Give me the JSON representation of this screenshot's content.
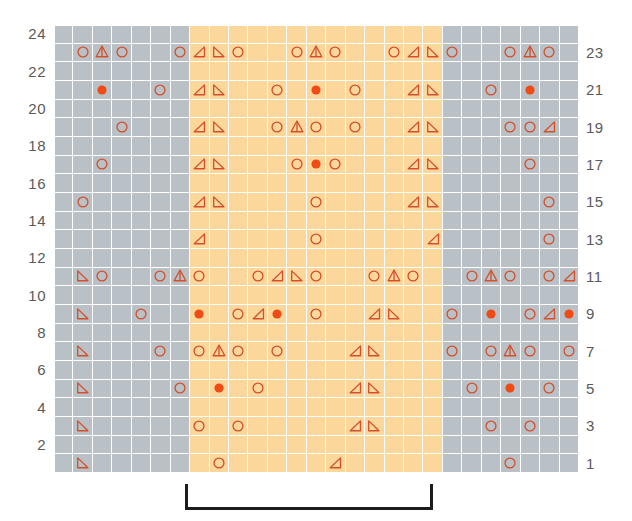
{
  "chart_meta": {
    "title": "Lace knitting chart",
    "columns": 27,
    "rows": 24,
    "repeat_start_col": 8,
    "repeat_end_col": 20,
    "colors": {
      "background_plain": "#b9c0c6",
      "background_repeat": "#fcd79b",
      "grid_line": "#ffffff",
      "symbol_outline": "#d4502a",
      "symbol_fill": "#f04b14",
      "symbol_muted": "#b06a55",
      "row_number": "#5a5a5a",
      "bracket": "#1c1c1c"
    }
  },
  "row_numbers_left": [
    "24",
    "22",
    "20",
    "18",
    "16",
    "14",
    "12",
    "10",
    "8",
    "6",
    "4",
    "2"
  ],
  "row_numbers_right": [
    "23",
    "21",
    "19",
    "17",
    "15",
    "13",
    "11",
    "9",
    "7",
    "5",
    "3",
    "1"
  ],
  "legend_symbols": {
    "yo": "open-circle-yarn-over",
    "dot": "filled-circle-bobble",
    "k2tog": "right-leaning-decrease-triangle",
    "ssk": "left-leaning-decrease-triangle",
    "cdd": "center-double-decrease-peak"
  },
  "repeat_bracket": {
    "label": "",
    "start_px": 185,
    "width_px": 248
  },
  "chart_data": {
    "type": "table",
    "xlabel": "stitch",
    "ylabel": "row",
    "columns": 27,
    "rows": 24,
    "symbol_key": {
      "o": "yarn over (open circle)",
      "d": "bobble / nupp (filled circle)",
      "L": "left-leaning decrease (triangle, right angle bottom-right)",
      "R": "right-leaning decrease (triangle, right angle bottom-left)",
      "A": "central double decrease (peak with stem)",
      ".": "empty / knit stitch"
    },
    "grid": [
      {
        "row": 23,
        "cells": [
          "",
          "o",
          "A",
          "o",
          "",
          "",
          "o",
          "L",
          "R",
          "o",
          "",
          "",
          "o",
          "A",
          "o",
          "",
          "",
          "o",
          "L",
          "R",
          "o",
          "",
          "",
          "o",
          "A",
          "o",
          ""
        ]
      },
      {
        "row": 22,
        "cells": [
          "",
          "",
          "",
          "",
          "",
          "",
          "",
          "",
          "",
          "",
          "",
          "",
          "",
          "",
          "",
          "",
          "",
          "",
          "",
          "",
          "",
          "",
          "",
          "",
          "",
          "",
          ""
        ]
      },
      {
        "row": 21,
        "cells": [
          "",
          "",
          "d",
          "",
          "o",
          "",
          "L",
          "R",
          "",
          "o",
          "",
          "d",
          "",
          "o",
          "",
          "d",
          "",
          "o",
          "",
          "L",
          "R",
          "",
          "o",
          "",
          "d",
          "",
          ""
        ]
      },
      {
        "row": 20,
        "cells": [
          "",
          "",
          "",
          "",
          "",
          "",
          "",
          "",
          "",
          "",
          "",
          "",
          "",
          "",
          "",
          "",
          "",
          "",
          "",
          "",
          "",
          "",
          "",
          "",
          "",
          "",
          ""
        ]
      },
      {
        "row": 19,
        "cells": [
          "",
          "",
          "",
          "o",
          "",
          "",
          "L",
          "R",
          "",
          "",
          "o",
          "",
          "o",
          "A",
          "o",
          "",
          "",
          "o",
          "",
          "",
          "L",
          "R",
          "",
          "",
          "o",
          "",
          "L"
        ]
      },
      {
        "row": 18,
        "cells": [
          "",
          "",
          "",
          "",
          "",
          "",
          "",
          "",
          "",
          "",
          "",
          "",
          "",
          "",
          "",
          "",
          "",
          "",
          "",
          "",
          "",
          "",
          "",
          "",
          "",
          "",
          ""
        ]
      },
      {
        "row": 17,
        "cells": [
          "",
          "",
          "o",
          "",
          "",
          "",
          "L",
          "R",
          "",
          "",
          "",
          "o",
          "",
          "d",
          "",
          "o",
          "",
          "",
          "",
          "L",
          "R",
          "",
          "",
          "",
          "o",
          "",
          ""
        ]
      },
      {
        "row": 16,
        "cells": [
          "",
          "",
          "",
          "",
          "",
          "",
          "",
          "",
          "",
          "",
          "",
          "",
          "",
          "",
          "",
          "",
          "",
          "",
          "",
          "",
          "",
          "",
          "",
          "",
          "",
          "",
          ""
        ]
      },
      {
        "row": 15,
        "cells": [
          "",
          "o",
          "",
          "",
          "",
          "",
          "L",
          "R",
          "",
          "",
          "",
          "",
          "o",
          "",
          "o",
          "",
          "",
          "",
          "",
          "L",
          "R",
          "",
          "",
          "",
          "",
          "o",
          ""
        ]
      },
      {
        "row": 14,
        "cells": [
          "",
          "",
          "",
          "",
          "",
          "",
          "",
          "",
          "",
          "",
          "",
          "",
          "",
          "",
          "",
          "",
          "",
          "",
          "",
          "",
          "",
          "",
          "",
          "",
          "",
          "",
          ""
        ]
      },
      {
        "row": 13,
        "cells": [
          "",
          "",
          "",
          "",
          "",
          "",
          "",
          "L",
          "",
          "",
          "",
          "",
          "",
          "o",
          "",
          "",
          "",
          "",
          "",
          "",
          "L",
          "",
          "",
          "",
          "",
          "",
          "o"
        ]
      },
      {
        "row": 12,
        "cells": [
          "",
          "",
          "",
          "",
          "",
          "",
          "",
          "",
          "",
          "",
          "",
          "",
          "",
          "",
          "",
          "",
          "",
          "",
          "",
          "",
          "",
          "",
          "",
          "",
          "",
          "",
          ""
        ]
      },
      {
        "row": 11,
        "cells": [
          "",
          "R",
          "o",
          "",
          "",
          "o",
          "A",
          "o",
          "",
          "",
          "o",
          "L",
          "R",
          "o",
          "",
          "",
          "o",
          "A",
          "o",
          "",
          "",
          "o",
          "A",
          "o",
          "",
          "",
          "o",
          "L"
        ]
      },
      {
        "row": 10,
        "cells": [
          "",
          "",
          "",
          "",
          "",
          "",
          "",
          "",
          "",
          "",
          "",
          "",
          "",
          "",
          "",
          "",
          "",
          "",
          "",
          "",
          "",
          "",
          "",
          "",
          "",
          "",
          ""
        ]
      },
      {
        "row": 9,
        "cells": [
          "",
          "R",
          "",
          "",
          "o",
          "",
          "",
          "d",
          "",
          "o",
          "L",
          "d",
          "",
          "o",
          "",
          "",
          "L",
          "R",
          "",
          "",
          "o",
          "",
          "",
          "d",
          "",
          "o",
          "L",
          "d"
        ]
      },
      {
        "row": 8,
        "cells": [
          "",
          "",
          "",
          "",
          "",
          "",
          "",
          "",
          "",
          "",
          "",
          "",
          "",
          "",
          "",
          "",
          "",
          "",
          "",
          "",
          "",
          "",
          "",
          "",
          "",
          "",
          ""
        ]
      },
      {
        "row": 7,
        "cells": [
          "",
          "R",
          "",
          "",
          "",
          "o",
          "",
          "o",
          "A",
          "o",
          "",
          "o",
          "",
          "",
          "",
          "L",
          "R",
          "",
          "",
          "",
          "o",
          "",
          "o",
          "A",
          "o",
          "",
          "o",
          ""
        ]
      },
      {
        "row": 6,
        "cells": [
          "",
          "",
          "",
          "",
          "",
          "",
          "",
          "",
          "",
          "",
          "",
          "",
          "",
          "",
          "",
          "",
          "",
          "",
          "",
          "",
          "",
          "",
          "",
          "",
          "",
          "",
          ""
        ]
      },
      {
        "row": 5,
        "cells": [
          "",
          "R",
          "",
          "",
          "",
          "",
          "o",
          "",
          "d",
          "",
          "o",
          "",
          "",
          "",
          "",
          "L",
          "R",
          "",
          "",
          "",
          "",
          "o",
          "",
          "d",
          "",
          "o",
          "",
          ""
        ]
      },
      {
        "row": 4,
        "cells": [
          "",
          "",
          "",
          "",
          "",
          "",
          "",
          "",
          "",
          "",
          "",
          "",
          "",
          "",
          "",
          "",
          "",
          "",
          "",
          "",
          "",
          "",
          "",
          "",
          "",
          "",
          ""
        ]
      },
      {
        "row": 3,
        "cells": [
          "",
          "R",
          "",
          "",
          "",
          "",
          "",
          "o",
          "",
          "o",
          "",
          "",
          "",
          "",
          "",
          "L",
          "R",
          "",
          "",
          "",
          "",
          "",
          "o",
          "",
          "o",
          "",
          "",
          ""
        ]
      },
      {
        "row": 2,
        "cells": [
          "",
          "",
          "",
          "",
          "",
          "",
          "",
          "",
          "",
          "",
          "",
          "",
          "",
          "",
          "",
          "",
          "",
          "",
          "",
          "",
          "",
          "",
          "",
          "",
          "",
          "",
          ""
        ]
      },
      {
        "row": 1,
        "cells": [
          "",
          "R",
          "",
          "",
          "",
          "",
          "",
          "",
          "o",
          "",
          "",
          "",
          "",
          "",
          "L",
          "",
          "",
          "",
          "",
          "",
          "",
          "",
          "",
          "o",
          "",
          "",
          "",
          ""
        ]
      }
    ],
    "symbols_by_row": {
      "23": [
        {
          "c": 2,
          "s": "o"
        },
        {
          "c": 3,
          "s": "A"
        },
        {
          "c": 4,
          "s": "o"
        },
        {
          "c": 7,
          "s": "o"
        },
        {
          "c": 8,
          "s": "L"
        },
        {
          "c": 9,
          "s": "R"
        },
        {
          "c": 10,
          "s": "o"
        },
        {
          "c": 13,
          "s": "o"
        },
        {
          "c": 14,
          "s": "A"
        },
        {
          "c": 15,
          "s": "o"
        },
        {
          "c": 18,
          "s": "o"
        },
        {
          "c": 19,
          "s": "L"
        },
        {
          "c": 20,
          "s": "R"
        },
        {
          "c": 21,
          "s": "o"
        },
        {
          "c": 24,
          "s": "o"
        },
        {
          "c": 25,
          "s": "A"
        },
        {
          "c": 26,
          "s": "o"
        }
      ],
      "21": [
        {
          "c": 3,
          "s": "d"
        },
        {
          "c": 6,
          "s": "o"
        },
        {
          "c": 8,
          "s": "L"
        },
        {
          "c": 9,
          "s": "R"
        },
        {
          "c": 12,
          "s": "o"
        },
        {
          "c": 14,
          "s": "d"
        },
        {
          "c": 16,
          "s": "o"
        },
        {
          "c": 19,
          "s": "L"
        },
        {
          "c": 20,
          "s": "R"
        },
        {
          "c": 23,
          "s": "o"
        },
        {
          "c": 25,
          "s": "d"
        }
      ],
      "19": [
        {
          "c": 4,
          "s": "o"
        },
        {
          "c": 8,
          "s": "L"
        },
        {
          "c": 9,
          "s": "R"
        },
        {
          "c": 12,
          "s": "o"
        },
        {
          "c": 13,
          "s": "A"
        },
        {
          "c": 14,
          "s": "o"
        },
        {
          "c": 16,
          "s": "o"
        },
        {
          "c": 19,
          "s": "L"
        },
        {
          "c": 20,
          "s": "R"
        },
        {
          "c": 24,
          "s": "o"
        },
        {
          "c": 25,
          "s": "o"
        },
        {
          "c": 26,
          "s": "L"
        }
      ],
      "17": [
        {
          "c": 3,
          "s": "o"
        },
        {
          "c": 8,
          "s": "L"
        },
        {
          "c": 9,
          "s": "R"
        },
        {
          "c": 13,
          "s": "o"
        },
        {
          "c": 14,
          "s": "d"
        },
        {
          "c": 15,
          "s": "o"
        },
        {
          "c": 19,
          "s": "L"
        },
        {
          "c": 20,
          "s": "R"
        },
        {
          "c": 25,
          "s": "o"
        }
      ],
      "15": [
        {
          "c": 2,
          "s": "o"
        },
        {
          "c": 8,
          "s": "L"
        },
        {
          "c": 9,
          "s": "R"
        },
        {
          "c": 14,
          "s": "o"
        },
        {
          "c": 19,
          "s": "L"
        },
        {
          "c": 20,
          "s": "R"
        },
        {
          "c": 26,
          "s": "o"
        }
      ],
      "13": [
        {
          "c": 8,
          "s": "L"
        },
        {
          "c": 14,
          "s": "o"
        },
        {
          "c": 20,
          "s": "L"
        },
        {
          "c": 26,
          "s": "o"
        }
      ],
      "11": [
        {
          "c": 2,
          "s": "R"
        },
        {
          "c": 3,
          "s": "o"
        },
        {
          "c": 6,
          "s": "o"
        },
        {
          "c": 7,
          "s": "A"
        },
        {
          "c": 8,
          "s": "o"
        },
        {
          "c": 11,
          "s": "o"
        },
        {
          "c": 12,
          "s": "L"
        },
        {
          "c": 13,
          "s": "R"
        },
        {
          "c": 14,
          "s": "o"
        },
        {
          "c": 17,
          "s": "o"
        },
        {
          "c": 18,
          "s": "A"
        },
        {
          "c": 19,
          "s": "o"
        },
        {
          "c": 22,
          "s": "o"
        },
        {
          "c": 23,
          "s": "A"
        },
        {
          "c": 24,
          "s": "o"
        },
        {
          "c": 26,
          "s": "o"
        },
        {
          "c": 27,
          "s": "L"
        }
      ],
      "9": [
        {
          "c": 2,
          "s": "R"
        },
        {
          "c": 5,
          "s": "o"
        },
        {
          "c": 8,
          "s": "d"
        },
        {
          "c": 10,
          "s": "o"
        },
        {
          "c": 11,
          "s": "L"
        },
        {
          "c": 12,
          "s": "d"
        },
        {
          "c": 14,
          "s": "o"
        },
        {
          "c": 17,
          "s": "L"
        },
        {
          "c": 18,
          "s": "R"
        },
        {
          "c": 21,
          "s": "o"
        },
        {
          "c": 23,
          "s": "d"
        },
        {
          "c": 25,
          "s": "o"
        },
        {
          "c": 26,
          "s": "L"
        },
        {
          "c": 27,
          "s": "d"
        }
      ],
      "7": [
        {
          "c": 2,
          "s": "R"
        },
        {
          "c": 6,
          "s": "o"
        },
        {
          "c": 8,
          "s": "o"
        },
        {
          "c": 9,
          "s": "A"
        },
        {
          "c": 10,
          "s": "o"
        },
        {
          "c": 12,
          "s": "o"
        },
        {
          "c": 16,
          "s": "L"
        },
        {
          "c": 17,
          "s": "R"
        },
        {
          "c": 21,
          "s": "o"
        },
        {
          "c": 23,
          "s": "o"
        },
        {
          "c": 24,
          "s": "A"
        },
        {
          "c": 25,
          "s": "o"
        },
        {
          "c": 27,
          "s": "o"
        }
      ],
      "5": [
        {
          "c": 2,
          "s": "R"
        },
        {
          "c": 7,
          "s": "o"
        },
        {
          "c": 9,
          "s": "d"
        },
        {
          "c": 11,
          "s": "o"
        },
        {
          "c": 16,
          "s": "L"
        },
        {
          "c": 17,
          "s": "R"
        },
        {
          "c": 22,
          "s": "o"
        },
        {
          "c": 24,
          "s": "d"
        },
        {
          "c": 26,
          "s": "o"
        }
      ],
      "3": [
        {
          "c": 2,
          "s": "R"
        },
        {
          "c": 8,
          "s": "o"
        },
        {
          "c": 10,
          "s": "o"
        },
        {
          "c": 16,
          "s": "L"
        },
        {
          "c": 17,
          "s": "R"
        },
        {
          "c": 23,
          "s": "o"
        },
        {
          "c": 25,
          "s": "o"
        }
      ],
      "1": [
        {
          "c": 2,
          "s": "R"
        },
        {
          "c": 9,
          "s": "o"
        },
        {
          "c": 15,
          "s": "L"
        },
        {
          "c": 24,
          "s": "o"
        }
      ]
    }
  }
}
